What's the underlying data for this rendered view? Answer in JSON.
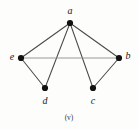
{
  "figure": {
    "caption": "(v)",
    "background_color": "#fdfdfc",
    "vertex_color": "#111111",
    "edge_color": "#4a4a4a",
    "edge_color_light": "#8d8d8d",
    "label_color": "#1a1a1a"
  },
  "chart_data": {
    "type": "diagram",
    "title": "(v)",
    "subtitle": "",
    "xlabel": "",
    "ylabel": "",
    "graph_kind": "undirected-simple-graph",
    "vertex_count": 5,
    "edge_count": 7,
    "nodes": [
      {
        "id": "a",
        "label": "a",
        "x": 70,
        "y": 23,
        "label_x": 70,
        "label_y": 12
      },
      {
        "id": "e",
        "label": "e",
        "x": 21,
        "y": 58,
        "label_x": 12,
        "label_y": 58
      },
      {
        "id": "b",
        "label": "b",
        "x": 119,
        "y": 58,
        "label_x": 128,
        "label_y": 57
      },
      {
        "id": "d",
        "label": "d",
        "x": 45,
        "y": 88,
        "label_x": 45,
        "label_y": 102
      },
      {
        "id": "c",
        "label": "c",
        "x": 93,
        "y": 88,
        "label_x": 93,
        "label_y": 102
      }
    ],
    "edges": [
      {
        "from": "a",
        "to": "e",
        "style": "dark"
      },
      {
        "from": "a",
        "to": "d",
        "style": "dark"
      },
      {
        "from": "a",
        "to": "c",
        "style": "dark"
      },
      {
        "from": "a",
        "to": "b",
        "style": "dark"
      },
      {
        "from": "e",
        "to": "b",
        "style": "light"
      },
      {
        "from": "e",
        "to": "d",
        "style": "dark"
      },
      {
        "from": "c",
        "to": "b",
        "style": "dark"
      }
    ],
    "degrees": {
      "a": 4,
      "b": 3,
      "c": 2,
      "d": 2,
      "e": 3
    },
    "legend": [],
    "annotations": [
      {
        "text": "(v)",
        "x": 69,
        "y": 118,
        "role": "figure-caption"
      }
    ],
    "grid": false,
    "legend_position": "none"
  }
}
